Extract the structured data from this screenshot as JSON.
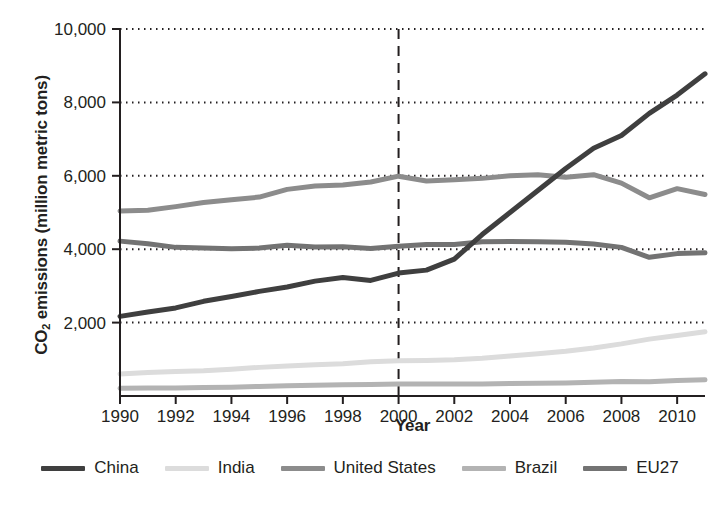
{
  "chart_data": {
    "type": "line",
    "title": "",
    "xlabel": "Year",
    "ylabel": "CO2 emissions (million metric tons)",
    "ylabel_parts": {
      "pre": "CO",
      "sub": "2",
      "post": " emissions (million metric tons)"
    },
    "x": [
      1990,
      1991,
      1992,
      1993,
      1994,
      1995,
      1996,
      1997,
      1998,
      1999,
      2000,
      2001,
      2002,
      2003,
      2004,
      2005,
      2006,
      2007,
      2008,
      2009,
      2010,
      2011
    ],
    "xlim": [
      1990,
      2011
    ],
    "ylim": [
      0,
      10000
    ],
    "xticks": [
      1990,
      1992,
      1994,
      1996,
      1998,
      2000,
      2002,
      2004,
      2006,
      2008,
      2010
    ],
    "xtick_labels": [
      "1990",
      "1992",
      "1994",
      "1996",
      "1998",
      "2000",
      "2002",
      "2004",
      "2006",
      "2008",
      "2010"
    ],
    "yticks": [
      2000,
      4000,
      6000,
      8000,
      10000
    ],
    "ytick_labels": [
      "2,000",
      "4,000",
      "6,000",
      "8,000",
      "10,000"
    ],
    "grid": "horizontal-dotted",
    "legend_position": "bottom",
    "annotations": [
      {
        "name": "reference-line-2000",
        "type": "vline",
        "x": 2000,
        "style": "dashed",
        "color": "#231f20"
      }
    ],
    "series": [
      {
        "name": "China",
        "color": "#3f3f3f",
        "width": 5,
        "values": [
          2170,
          2290,
          2400,
          2580,
          2710,
          2850,
          2970,
          3130,
          3230,
          3150,
          3350,
          3430,
          3730,
          4400,
          5000,
          5600,
          6200,
          6750,
          7100,
          7700,
          8200,
          8780
        ]
      },
      {
        "name": "India",
        "color": "#dcdcdc",
        "width": 5,
        "values": [
          600,
          640,
          670,
          690,
          730,
          780,
          820,
          850,
          880,
          930,
          960,
          970,
          990,
          1030,
          1090,
          1150,
          1220,
          1310,
          1420,
          1550,
          1650,
          1750
        ]
      },
      {
        "name": "United States",
        "color": "#8c8c8c",
        "width": 5,
        "values": [
          5040,
          5060,
          5160,
          5270,
          5350,
          5420,
          5630,
          5720,
          5750,
          5830,
          5990,
          5860,
          5890,
          5930,
          6000,
          6030,
          5960,
          6030,
          5800,
          5400,
          5650,
          5490
        ]
      },
      {
        "name": "Brazil",
        "color": "#b3b3b3",
        "width": 5,
        "values": [
          210,
          215,
          220,
          230,
          240,
          260,
          280,
          295,
          305,
          315,
          325,
          330,
          330,
          325,
          340,
          350,
          355,
          375,
          395,
          385,
          420,
          440
        ]
      },
      {
        "name": "EU27",
        "color": "#737373",
        "width": 5,
        "values": [
          4220,
          4150,
          4050,
          4030,
          4010,
          4030,
          4110,
          4060,
          4070,
          4020,
          4080,
          4130,
          4130,
          4200,
          4210,
          4200,
          4190,
          4140,
          4050,
          3780,
          3880,
          3900
        ]
      }
    ]
  },
  "legend": {
    "items": [
      {
        "label": "China",
        "color": "#3f3f3f"
      },
      {
        "label": "India",
        "color": "#dcdcdc"
      },
      {
        "label": "United States",
        "color": "#8c8c8c"
      },
      {
        "label": "Brazil",
        "color": "#b3b3b3"
      },
      {
        "label": "EU27",
        "color": "#737373"
      }
    ]
  }
}
